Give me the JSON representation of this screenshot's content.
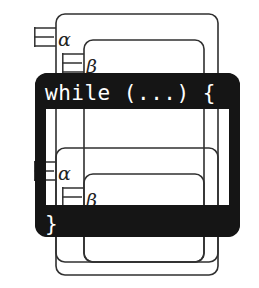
{
  "figure": {
    "canvas": {
      "width": 259,
      "height": 288,
      "background": "#ffffff"
    },
    "colors": {
      "scope_stroke": "#303030",
      "block_fill": "#151515",
      "block_text": "#ffffff",
      "background": "#ffffff"
    }
  },
  "code_block": {
    "name": "while-block",
    "header_label": "while (...) {",
    "footer_label": "}",
    "frame": {
      "x": 35,
      "y": 73,
      "width": 205,
      "height": 164,
      "corner_radius": 12,
      "border_width": 11
    },
    "header_bar": {
      "x": 35,
      "y": 73,
      "width": 205,
      "height": 36
    },
    "footer_bar": {
      "x": 35,
      "y": 205,
      "width": 205,
      "height": 32
    },
    "header_text_pos": {
      "x": 45,
      "y": 99
    },
    "footer_text_pos": {
      "x": 45,
      "y": 231
    }
  },
  "scopes": [
    {
      "id": "alpha-outer",
      "label": "α",
      "quantifier": "∃",
      "rect": {
        "x": 56,
        "y": 14,
        "width": 162,
        "height": 261,
        "rx": 9
      },
      "marker": {
        "x": 34,
        "y": 28,
        "width": 22,
        "height": 18
      },
      "label_pos": {
        "x": 58,
        "y": 45
      }
    },
    {
      "id": "beta-outer",
      "label": "β",
      "quantifier": "∃",
      "rect": {
        "x": 84,
        "y": 40,
        "width": 120,
        "height": 222,
        "rx": 9
      },
      "marker": {
        "x": 62,
        "y": 54,
        "width": 22,
        "height": 18
      },
      "label_pos": {
        "x": 86,
        "y": 71
      }
    },
    {
      "id": "alpha-inner",
      "label": "α",
      "quantifier": "∃",
      "rect": {
        "x": 56,
        "y": 148,
        "width": 162,
        "height": 114,
        "rx": 9
      },
      "marker": {
        "x": 34,
        "y": 162,
        "width": 22,
        "height": 18
      },
      "label_pos": {
        "x": 58,
        "y": 179
      }
    },
    {
      "id": "beta-inner",
      "label": "β",
      "quantifier": "∃",
      "rect": {
        "x": 84,
        "y": 174,
        "width": 120,
        "height": 88,
        "rx": 9
      },
      "marker": {
        "x": 62,
        "y": 188,
        "width": 22,
        "height": 18
      },
      "label_pos": {
        "x": 86,
        "y": 205
      }
    }
  ]
}
